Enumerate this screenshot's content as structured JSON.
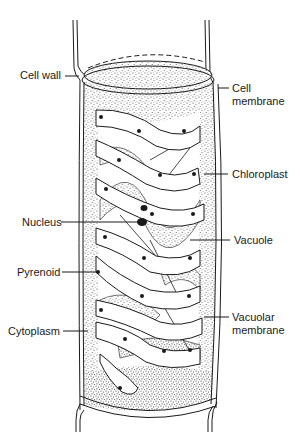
{
  "diagram": {
    "labels": {
      "cell_wall": "Cell wall",
      "cell_membrane_line1": "Cell",
      "cell_membrane_line2": "membrane",
      "chloroplast": "Chloroplast",
      "nucleus": "Nucleus",
      "vacuole": "Vacuole",
      "pyrenoid": "Pyrenoid",
      "vacuolar_membrane_line1": "Vacuolar",
      "vacuolar_membrane_line2": "membrane",
      "cytoplasm": "Cytoplasm"
    },
    "colors": {
      "ink": "#1a1a1a",
      "background": "#ffffff",
      "stipple": "#555555"
    }
  }
}
